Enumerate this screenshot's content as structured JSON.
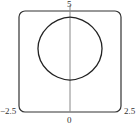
{
  "chart_data": {
    "type": "line",
    "title": "",
    "xlabel": "",
    "ylabel": "",
    "xlim": [
      -2.5,
      2.5
    ],
    "ylim": [
      0,
      5
    ],
    "grid": false,
    "legend": null,
    "tick_labels": {
      "x_left": "−2.5",
      "x_right": "2.5",
      "x_origin": "0",
      "y_top": "5"
    },
    "series": [
      {
        "name": "closed curve",
        "description": "Closed rounded-square-like loop centered near (0, 3.14), horizontal half-width about 1.57, vertical span about 1.58 to 4.7",
        "x": [
          0,
          0.6,
          1.1,
          1.45,
          1.57,
          1.45,
          1.1,
          0.6,
          0,
          -0.6,
          -1.1,
          -1.45,
          -1.57,
          -1.45,
          -1.1,
          -0.6,
          0
        ],
        "y": [
          4.7,
          4.55,
          4.2,
          3.7,
          3.14,
          2.55,
          2.05,
          1.72,
          1.58,
          1.72,
          2.05,
          2.55,
          3.14,
          3.7,
          4.2,
          4.55,
          4.7
        ]
      }
    ],
    "axes": {
      "y_axis_at_x": 0,
      "frame": "rounded-square"
    }
  },
  "colors": {
    "curve": "#222222",
    "frame": "#333333",
    "axis": "#888888",
    "text": "#333333"
  }
}
